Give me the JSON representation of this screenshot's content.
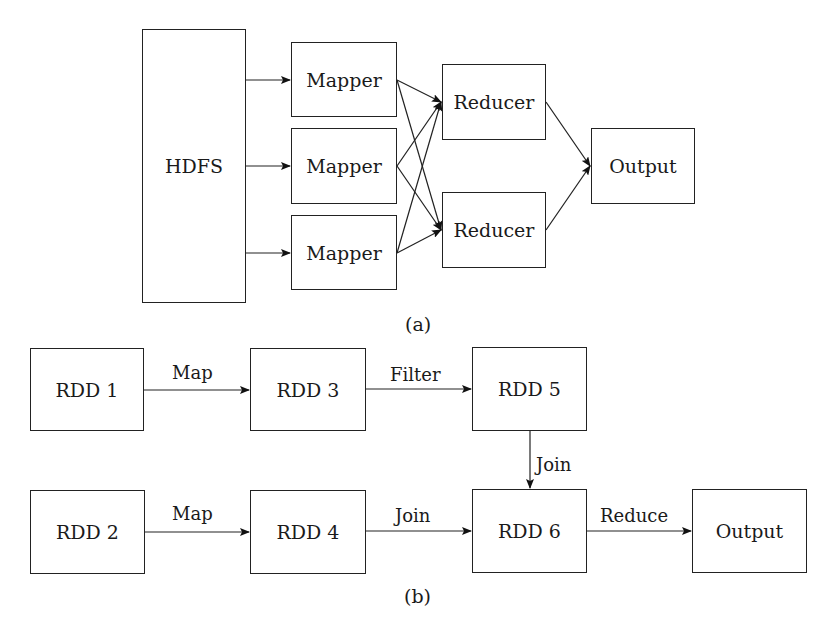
{
  "header": {
    "cut_off_title": "Comparison of MapReduce and Spark execution models"
  },
  "diagram_a": {
    "caption": "(a)",
    "source": {
      "label": "HDFS"
    },
    "mappers": [
      {
        "label": "Mapper"
      },
      {
        "label": "Mapper"
      },
      {
        "label": "Mapper"
      }
    ],
    "reducers": [
      {
        "label": "Reducer"
      },
      {
        "label": "Reducer"
      }
    ],
    "output": {
      "label": "Output"
    }
  },
  "diagram_b": {
    "caption": "(b)",
    "nodes": {
      "rdd1": "RDD 1",
      "rdd2": "RDD 2",
      "rdd3": "RDD 3",
      "rdd4": "RDD 4",
      "rdd5": "RDD 5",
      "rdd6": "RDD 6",
      "output": "Output"
    },
    "edges": {
      "rdd1_rdd3": "Map",
      "rdd3_rdd5": "Filter",
      "rdd5_rdd6": "Join",
      "rdd2_rdd4": "Map",
      "rdd4_rdd6": "Join",
      "rdd6_output": "Reduce"
    }
  }
}
